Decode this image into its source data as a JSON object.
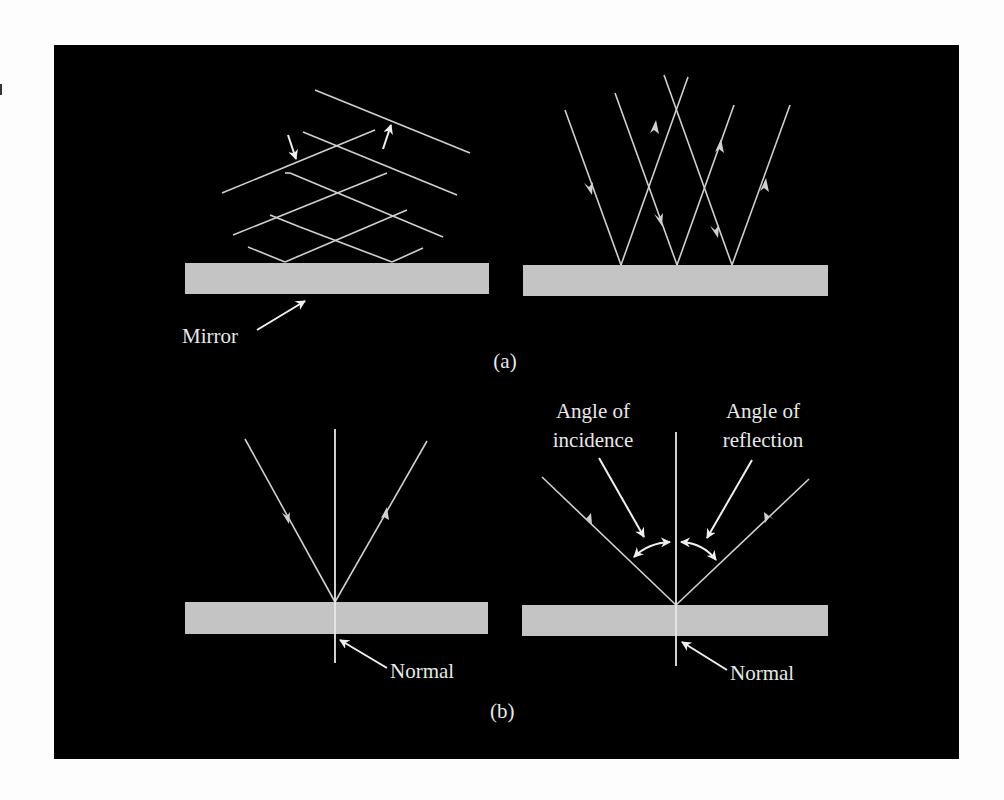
{
  "figure": {
    "background_color": "#000000",
    "line_color": "#d8d8d8",
    "mirror_color": "#c4c4c4",
    "panel_a": {
      "caption": "(a)",
      "mirror_label": "Mirror"
    },
    "panel_b": {
      "caption": "(b)",
      "normal_label_left": "Normal",
      "normal_label_right": "Normal",
      "angle_incidence_line1": "Angle of",
      "angle_incidence_line2": "incidence",
      "angle_reflection_line1": "Angle of",
      "angle_reflection_line2": "reflection"
    }
  }
}
